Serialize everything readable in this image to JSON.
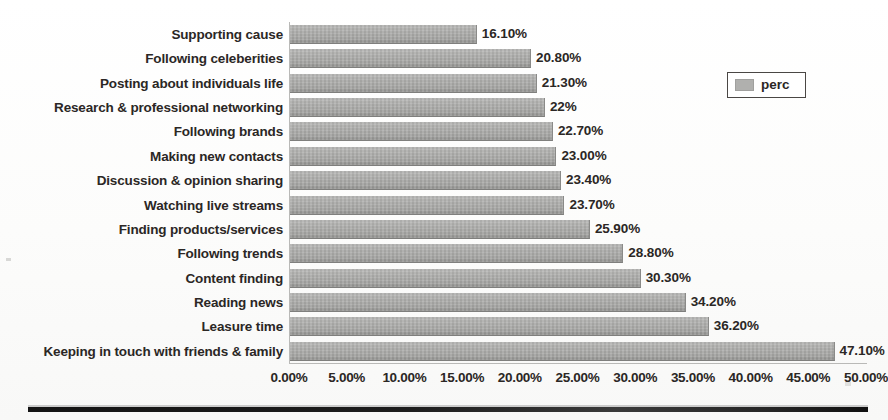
{
  "chart_data": {
    "type": "bar",
    "orientation": "horizontal",
    "title": "",
    "subtitle": "",
    "xlabel": "",
    "ylabel": "",
    "xlim": [
      0,
      50
    ],
    "xtick_step": 5,
    "grid": false,
    "legend_position": "top-right",
    "series_name": "perc",
    "bar_color": "#aaaaa8",
    "categories": [
      "Supporting cause",
      "Following celeberities",
      "Posting about individuals life",
      "Research & professional networking",
      "Following brands",
      "Making new contacts",
      "Discussion & opinion sharing",
      "Watching live streams",
      "Finding products/services",
      "Following trends",
      "Content finding",
      "Reading news",
      "Leasure time",
      "Keeping in touch with friends & family"
    ],
    "values": [
      16.1,
      20.8,
      21.3,
      22.0,
      22.7,
      23.0,
      23.4,
      23.7,
      25.9,
      28.8,
      30.3,
      34.2,
      36.2,
      47.1
    ],
    "data_labels": [
      "16.10%",
      "20.80%",
      "21.30%",
      "22%",
      "22.70%",
      "23.00%",
      "23.40%",
      "23.70%",
      "25.90%",
      "28.80%",
      "30.30%",
      "34.20%",
      "36.20%",
      "47.10%"
    ],
    "xtick_labels": [
      "0.00%",
      "5.00%",
      "10.00%",
      "15.00%",
      "20.00%",
      "25.00%",
      "30.00%",
      "35.00%",
      "40.00%",
      "45.00%",
      "50.00%"
    ],
    "xtick_values": [
      0,
      5,
      10,
      15,
      20,
      25,
      30,
      35,
      40,
      45,
      50
    ]
  },
  "legend": {
    "label": "perc",
    "swatch_color": "#b0b0ae"
  }
}
